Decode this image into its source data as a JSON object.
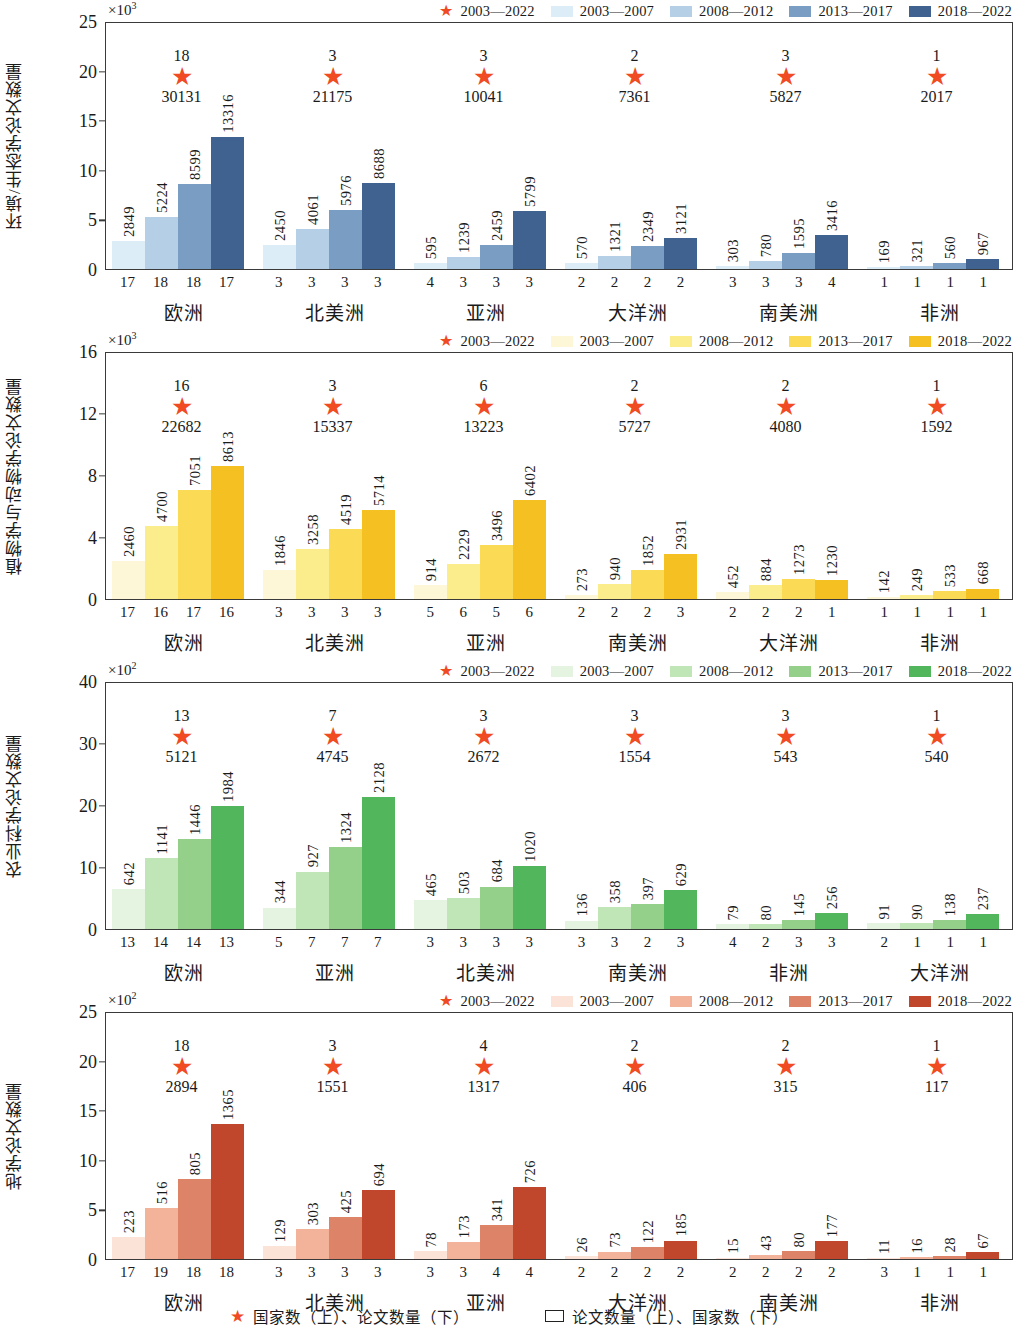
{
  "figure": {
    "bottom_legend": [
      {
        "marker": "star",
        "label": "国家数（上）、论文数量（下）"
      },
      {
        "marker": "box",
        "label": "论文数量（上）、国家数（下）"
      }
    ]
  },
  "chart_data": [
    {
      "type": "bar",
      "id": "panel-1",
      "title": "",
      "ylabel": "环境/生态学论文数量",
      "y_exponent": "×10",
      "y_exponent_sup": "3",
      "ylim": [
        0,
        25
      ],
      "yticks": [
        0,
        5,
        10,
        15,
        20,
        25
      ],
      "scale": 1000,
      "grid": false,
      "legend_position": "top-right",
      "legend": [
        {
          "marker": "star",
          "label": "2003—2022",
          "color": "#f04b23"
        },
        {
          "marker": "swatch",
          "label": "2003—2007",
          "color": "#dcedf7"
        },
        {
          "marker": "swatch",
          "label": "2008—2012",
          "color": "#b4cfe6"
        },
        {
          "marker": "swatch",
          "label": "2013—2017",
          "color": "#7a9dc4"
        },
        {
          "marker": "swatch",
          "label": "2018—2022",
          "color": "#3f6291"
        }
      ],
      "categories": [
        "欧洲",
        "北美洲",
        "亚洲",
        "大洋洲",
        "南美洲",
        "非洲"
      ],
      "series": [
        {
          "name": "2003—2007",
          "color": "#dcedf7",
          "values": [
            2849,
            2450,
            595,
            570,
            303,
            169
          ]
        },
        {
          "name": "2008—2012",
          "color": "#b4cfe6",
          "values": [
            5224,
            4061,
            1239,
            1321,
            780,
            321
          ]
        },
        {
          "name": "2013—2017",
          "color": "#7a9dc4",
          "values": [
            8599,
            5976,
            2459,
            2349,
            1595,
            560
          ]
        },
        {
          "name": "2018—2022",
          "color": "#3f6291",
          "values": [
            13316,
            8688,
            5799,
            3121,
            3416,
            967
          ]
        }
      ],
      "country_counts": [
        [
          17,
          18,
          18,
          17
        ],
        [
          3,
          3,
          3,
          3
        ],
        [
          4,
          3,
          3,
          3
        ],
        [
          2,
          2,
          2,
          2
        ],
        [
          3,
          3,
          3,
          4
        ],
        [
          1,
          1,
          1,
          1
        ]
      ],
      "totals": {
        "country_counts": [
          18,
          3,
          3,
          2,
          3,
          1
        ],
        "paper_counts": [
          30131,
          21175,
          10041,
          7361,
          5827,
          2017
        ]
      }
    },
    {
      "type": "bar",
      "id": "panel-2",
      "title": "",
      "ylabel": "植物学与动物学论文数量",
      "y_exponent": "×10",
      "y_exponent_sup": "3",
      "ylim": [
        0,
        16
      ],
      "yticks": [
        0,
        4,
        8,
        12,
        16
      ],
      "scale": 1000,
      "grid": false,
      "legend_position": "top-right",
      "legend": [
        {
          "marker": "star",
          "label": "2003—2022",
          "color": "#f04b23"
        },
        {
          "marker": "swatch",
          "label": "2003—2007",
          "color": "#fdf6d7"
        },
        {
          "marker": "swatch",
          "label": "2008—2012",
          "color": "#fced8c"
        },
        {
          "marker": "swatch",
          "label": "2013—2017",
          "color": "#fbda56"
        },
        {
          "marker": "swatch",
          "label": "2018—2022",
          "color": "#f5c021"
        }
      ],
      "categories": [
        "欧洲",
        "北美洲",
        "亚洲",
        "南美洲",
        "大洋洲",
        "非洲"
      ],
      "series": [
        {
          "name": "2003—2007",
          "color": "#fdf6d7",
          "values": [
            2460,
            1846,
            914,
            273,
            452,
            142
          ]
        },
        {
          "name": "2008—2012",
          "color": "#fced8c",
          "values": [
            4700,
            3258,
            2229,
            940,
            884,
            249
          ]
        },
        {
          "name": "2013—2017",
          "color": "#fbda56",
          "values": [
            7051,
            4519,
            3496,
            1852,
            1273,
            533
          ]
        },
        {
          "name": "2018—2022",
          "color": "#f5c021",
          "values": [
            8613,
            5714,
            6402,
            2931,
            1230,
            668
          ]
        }
      ],
      "country_counts": [
        [
          17,
          16,
          17,
          16
        ],
        [
          3,
          3,
          3,
          3
        ],
        [
          5,
          6,
          5,
          6
        ],
        [
          2,
          2,
          2,
          3
        ],
        [
          2,
          2,
          2,
          1
        ],
        [
          1,
          1,
          1,
          1
        ]
      ],
      "totals": {
        "country_counts": [
          16,
          3,
          6,
          2,
          2,
          1
        ],
        "paper_counts": [
          22682,
          15337,
          13223,
          5727,
          4080,
          1592
        ]
      }
    },
    {
      "type": "bar",
      "id": "panel-3",
      "title": "",
      "ylabel": "农业科学论文数量",
      "y_exponent": "×10",
      "y_exponent_sup": "2",
      "ylim": [
        0,
        40
      ],
      "yticks": [
        0,
        10,
        20,
        30,
        40
      ],
      "scale": 100,
      "grid": false,
      "legend_position": "top-right",
      "legend": [
        {
          "marker": "star",
          "label": "2003—2022",
          "color": "#f04b23"
        },
        {
          "marker": "swatch",
          "label": "2003—2007",
          "color": "#e4f4e0"
        },
        {
          "marker": "swatch",
          "label": "2008—2012",
          "color": "#c0e6b8"
        },
        {
          "marker": "swatch",
          "label": "2013—2017",
          "color": "#95d08b"
        },
        {
          "marker": "swatch",
          "label": "2018—2022",
          "color": "#52b65c"
        }
      ],
      "categories": [
        "欧洲",
        "亚洲",
        "北美洲",
        "南美洲",
        "非洲",
        "大洋洲"
      ],
      "series": [
        {
          "name": "2003—2007",
          "color": "#e4f4e0",
          "values": [
            642,
            344,
            465,
            136,
            79,
            91
          ]
        },
        {
          "name": "2008—2012",
          "color": "#c0e6b8",
          "values": [
            1141,
            927,
            503,
            358,
            80,
            90
          ]
        },
        {
          "name": "2013—2017",
          "color": "#95d08b",
          "values": [
            1446,
            1324,
            684,
            397,
            145,
            138
          ]
        },
        {
          "name": "2018—2022",
          "color": "#52b65c",
          "values": [
            1984,
            2128,
            1020,
            629,
            256,
            237
          ]
        }
      ],
      "country_counts": [
        [
          13,
          14,
          14,
          13
        ],
        [
          5,
          7,
          7,
          7
        ],
        [
          3,
          3,
          3,
          3
        ],
        [
          3,
          3,
          2,
          3
        ],
        [
          4,
          2,
          3,
          3
        ],
        [
          2,
          1,
          1,
          1
        ]
      ],
      "totals": {
        "country_counts": [
          13,
          7,
          3,
          3,
          3,
          1
        ],
        "paper_counts": [
          5121,
          4745,
          2672,
          1554,
          543,
          540
        ]
      }
    },
    {
      "type": "bar",
      "id": "panel-4",
      "title": "",
      "ylabel": "地学论文数量",
      "y_exponent": "×10",
      "y_exponent_sup": "2",
      "ylim": [
        0,
        25
      ],
      "yticks": [
        0,
        5,
        10,
        15,
        20,
        25
      ],
      "scale": 100,
      "grid": false,
      "legend_position": "top-right",
      "legend": [
        {
          "marker": "star",
          "label": "2003—2022",
          "color": "#f04b23"
        },
        {
          "marker": "swatch",
          "label": "2003—2007",
          "color": "#fbe3d8"
        },
        {
          "marker": "swatch",
          "label": "2008—2012",
          "color": "#f2b39a"
        },
        {
          "marker": "swatch",
          "label": "2013—2017",
          "color": "#dd8368"
        },
        {
          "marker": "swatch",
          "label": "2018—2022",
          "color": "#c0472c"
        }
      ],
      "categories": [
        "欧洲",
        "北美洲",
        "亚洲",
        "大洋洲",
        "南美洲",
        "非洲"
      ],
      "series": [
        {
          "name": "2003—2007",
          "color": "#fbe3d8",
          "values": [
            223,
            129,
            78,
            26,
            15,
            11
          ]
        },
        {
          "name": "2008—2012",
          "color": "#f2b39a",
          "values": [
            516,
            303,
            173,
            73,
            43,
            16
          ]
        },
        {
          "name": "2013—2017",
          "color": "#dd8368",
          "values": [
            805,
            425,
            341,
            122,
            80,
            28
          ]
        },
        {
          "name": "2018—2022",
          "color": "#c0472c",
          "values": [
            1365,
            694,
            726,
            185,
            177,
            67
          ]
        }
      ],
      "country_counts": [
        [
          17,
          19,
          18,
          18
        ],
        [
          3,
          3,
          3,
          3
        ],
        [
          3,
          3,
          4,
          4
        ],
        [
          2,
          2,
          2,
          2
        ],
        [
          2,
          2,
          2,
          2
        ],
        [
          3,
          1,
          1,
          1
        ]
      ],
      "totals": {
        "country_counts": [
          18,
          3,
          4,
          2,
          2,
          1
        ],
        "paper_counts": [
          2894,
          1551,
          1317,
          406,
          315,
          117
        ]
      }
    }
  ]
}
